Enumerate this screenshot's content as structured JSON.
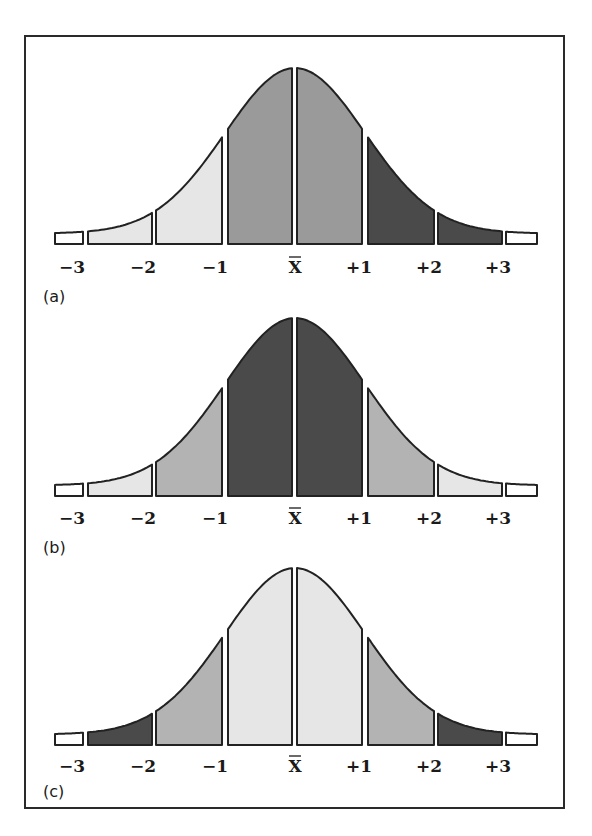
{
  "figure": {
    "border_color": "#2a2a2a",
    "stroke_color": "#222222",
    "shades": {
      "white": "#ffffff",
      "light": "#e6e6e6",
      "medium": "#b3b3b3",
      "medium_dark": "#9a9a9a",
      "dark": "#4a4a4a"
    },
    "axis_labels": [
      "−3",
      "−2",
      "−1",
      "X",
      "+1",
      "+2",
      "+3"
    ],
    "mean_symbol": "X̄",
    "panels": [
      {
        "label": "(a)",
        "segments": [
          {
            "range": "<-3",
            "shade": "white"
          },
          {
            "range": "-3..-2",
            "shade": "light"
          },
          {
            "range": "-2..-1",
            "shade": "light"
          },
          {
            "range": "-1..0",
            "shade": "medium_dark"
          },
          {
            "range": "0..+1",
            "shade": "medium_dark"
          },
          {
            "range": "+1..+2",
            "shade": "dark"
          },
          {
            "range": "+2..+3",
            "shade": "dark"
          },
          {
            "range": ">+3",
            "shade": "white"
          }
        ]
      },
      {
        "label": "(b)",
        "segments": [
          {
            "range": "<-3",
            "shade": "white"
          },
          {
            "range": "-3..-2",
            "shade": "light"
          },
          {
            "range": "-2..-1",
            "shade": "medium"
          },
          {
            "range": "-1..0",
            "shade": "dark"
          },
          {
            "range": "0..+1",
            "shade": "dark"
          },
          {
            "range": "+1..+2",
            "shade": "medium"
          },
          {
            "range": "+2..+3",
            "shade": "light"
          },
          {
            "range": ">+3",
            "shade": "white"
          }
        ]
      },
      {
        "label": "(c)",
        "segments": [
          {
            "range": "<-3",
            "shade": "white"
          },
          {
            "range": "-3..-2",
            "shade": "dark"
          },
          {
            "range": "-2..-1",
            "shade": "medium"
          },
          {
            "range": "-1..0",
            "shade": "light"
          },
          {
            "range": "0..+1",
            "shade": "light"
          },
          {
            "range": "+1..+2",
            "shade": "medium"
          },
          {
            "range": "+2..+3",
            "shade": "dark"
          },
          {
            "range": ">+3",
            "shade": "white"
          }
        ]
      }
    ]
  }
}
